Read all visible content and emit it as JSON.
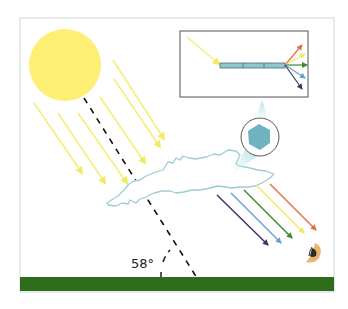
{
  "diagram": {
    "angle_label": "58°",
    "colors": {
      "frame": "#c9d9dc",
      "sun": "#fcef74",
      "sunray": "#f5ef7a",
      "sight_line": "#111111",
      "cloud_stroke": "#9ecbd4",
      "crystal": "#6fb3c0",
      "crystal_ring": "#555555",
      "callout": "#bfe3ea",
      "inset_border": "#555555",
      "prism_bar": "#8cc7cc",
      "ground": "#2e6d1c",
      "eye_skin": "#e9b56a",
      "eye_pupil": "#2a2a2a"
    },
    "spectrum": [
      {
        "name": "red",
        "color": "#e3703c"
      },
      {
        "name": "yellow",
        "color": "#f0ea5e"
      },
      {
        "name": "green",
        "color": "#3c8a2e"
      },
      {
        "name": "blue",
        "color": "#6a9fd6"
      },
      {
        "name": "violet",
        "color": "#3f3560"
      }
    ],
    "labels": {
      "sun": "sun",
      "ice_crystal": "hexagonal ice crystal",
      "cloud": "cirrus cloud",
      "observer": "observer eye",
      "ground": "ground"
    }
  }
}
